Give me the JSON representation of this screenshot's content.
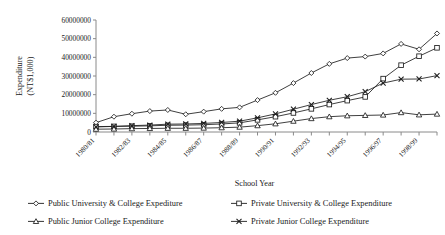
{
  "chart_data": {
    "type": "line",
    "title": "",
    "xlabel": "School Year",
    "ylabel": "Expenditure\n(NT$1,000)",
    "ylabel_line1": "Expenditure",
    "ylabel_line2": "(NT$1,000)",
    "ylim": [
      0,
      60000000
    ],
    "ytick_values": [
      0,
      10000000,
      20000000,
      30000000,
      40000000,
      50000000,
      60000000
    ],
    "ytick_labels": [
      "0",
      "10000000",
      "20000000",
      "30000000",
      "40000000",
      "50000000",
      "60000000"
    ],
    "grid": false,
    "legend_position": "bottom",
    "x": [
      "1980/81",
      "1981/82",
      "1982/83",
      "1983/84",
      "1984/85",
      "1985/86",
      "1986/87",
      "1987/88",
      "1988/89",
      "1989/90",
      "1990/91",
      "1991/92",
      "1992/93",
      "1993/94",
      "1994/95",
      "1995/96",
      "1996/97",
      "1997/98",
      "1998/99",
      "1999/00"
    ],
    "xtick_labels_shown": [
      "1980/81",
      "1982/83",
      "1984/85",
      "1986/87",
      "1988/89",
      "1990/91",
      "1992/93",
      "1994/95",
      "1996/97",
      "1998/99"
    ],
    "series": [
      {
        "name": "Public University & College Expediture",
        "marker": "diamond",
        "values": [
          5000000,
          8200000,
          9800000,
          11200000,
          11800000,
          9500000,
          10900000,
          12400000,
          13200000,
          17100000,
          21000000,
          26200000,
          31600000,
          36500000,
          39600000,
          40400000,
          42100000,
          47200000,
          44300000,
          52800000
        ]
      },
      {
        "name": "Private University & College Expenditure",
        "marker": "square",
        "values": [
          2900000,
          3000000,
          3100000,
          3300000,
          3600000,
          3700000,
          3900000,
          4300000,
          4900000,
          6500000,
          8200000,
          10200000,
          12400000,
          14700000,
          16800000,
          18800000,
          28600000,
          35800000,
          40600000,
          45100000
        ]
      },
      {
        "name": "Public Junior College Expenditure",
        "marker": "triangle",
        "values": [
          1500000,
          1600000,
          1800000,
          1900000,
          2000000,
          2000000,
          2100000,
          2300000,
          2600000,
          3400000,
          4400000,
          5800000,
          7200000,
          8200000,
          8700000,
          8900000,
          9100000,
          10400000,
          9200000,
          9600000
        ]
      },
      {
        "name": "Private Junior College Expenditure",
        "marker": "cross",
        "values": [
          2700000,
          3000000,
          3400000,
          3700000,
          4200000,
          4300000,
          4600000,
          5100000,
          5800000,
          7600000,
          9700000,
          12200000,
          14700000,
          17000000,
          18900000,
          21600000,
          26200000,
          28300000,
          28400000,
          30200000
        ]
      }
    ],
    "legend": [
      {
        "label": "Public University & College Expediture",
        "marker": "diamond"
      },
      {
        "label": "Private University & College Expenditure",
        "marker": "square"
      },
      {
        "label": "Public Junior College Expenditure",
        "marker": "triangle"
      },
      {
        "label": "Private Junior College Expenditure",
        "marker": "cross"
      }
    ]
  }
}
